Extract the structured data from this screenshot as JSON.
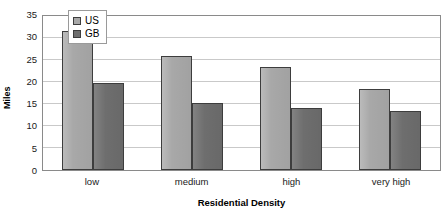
{
  "chart_data": {
    "type": "bar",
    "title": "",
    "subtitle": "",
    "xlabel": "Residential Density",
    "ylabel": "Miles",
    "categories": [
      "low",
      "medium",
      "high",
      "very high"
    ],
    "series": [
      {
        "name": "US",
        "values": [
          31.5,
          26.0,
          23.5,
          18.3
        ],
        "color": "#a8a8a8"
      },
      {
        "name": "GB",
        "values": [
          19.7,
          15.2,
          14.1,
          13.3
        ],
        "color": "#6e6e6e"
      }
    ],
    "ylim": [
      0,
      35
    ],
    "ytick_step": 5,
    "yticks": [
      35,
      30,
      25,
      20,
      15,
      10,
      5,
      0
    ],
    "ytick_labels": [
      "35",
      "30",
      "25",
      "20",
      "15",
      "10",
      "5",
      "0"
    ],
    "grid": "horizontal",
    "legend_position": "inside-upper-left",
    "legend_entries": [
      "US",
      "GB"
    ],
    "annotations": []
  },
  "colors": {
    "background": "#ffffff",
    "plot_border": "#8a8a8a",
    "gridline": "#c9c9c9",
    "bar_outline": "#3d3d3d",
    "series_us": "#a8a8a8",
    "series_gb": "#6e6e6e",
    "text": "#000000"
  }
}
